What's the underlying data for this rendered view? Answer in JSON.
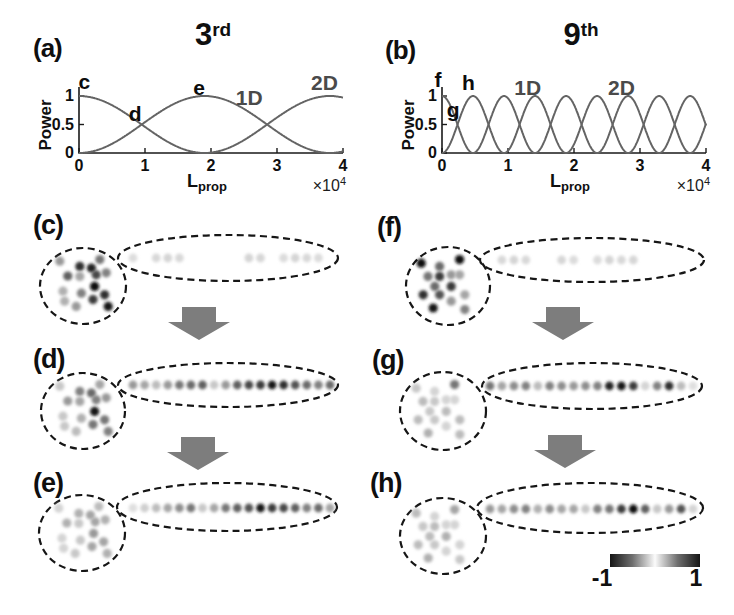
{
  "colors": {
    "curve": "#646464",
    "axis": "#1a1a1a",
    "dash": "#161616",
    "arrow": "#7d7d7d",
    "annotation_black": "#0c0c0c",
    "annotation_gray": "#4a4a4a"
  },
  "chart_data": [
    {
      "id": "a",
      "type": "line",
      "panel_label": "(a)",
      "title": "3rd",
      "title_base": "3",
      "title_sup": "rd",
      "ylabel": "Power",
      "xlabel_base": "L",
      "xlabel_sub": "prop",
      "x_multiplier_text": "×10",
      "x_multiplier_sup": "4",
      "xlim": [
        0,
        4
      ],
      "ylim": [
        0,
        1
      ],
      "xticks": [
        "0",
        "1",
        "2",
        "3",
        "4"
      ],
      "yticks": [
        "0",
        "0.5",
        "1"
      ],
      "series": [
        {
          "name": "2D",
          "fn": "cos2",
          "period": 3.8,
          "peak_x": [
            0,
            3.8
          ],
          "zero_x": [
            1.9
          ]
        },
        {
          "name": "1D",
          "fn": "sin2",
          "period": 3.8,
          "peak_x": [
            1.9
          ],
          "zero_x": [
            0,
            3.8
          ]
        }
      ],
      "annotations": [
        {
          "text": "c",
          "x": 0.08,
          "y": 1.24,
          "style": "black"
        },
        {
          "text": "d",
          "x": 0.85,
          "y": 0.68,
          "style": "black"
        },
        {
          "text": "e",
          "x": 1.82,
          "y": 1.14,
          "style": "black"
        },
        {
          "text": "1D",
          "x": 2.58,
          "y": 0.97,
          "style": "gray"
        },
        {
          "text": "2D",
          "x": 3.72,
          "y": 1.22,
          "style": "gray"
        }
      ]
    },
    {
      "id": "b",
      "type": "line",
      "panel_label": "(b)",
      "title": "9th",
      "title_base": "9",
      "title_sup": "th",
      "ylabel": "Power",
      "xlabel_base": "L",
      "xlabel_sub": "prop",
      "x_multiplier_text": "×10",
      "x_multiplier_sup": "4",
      "xlim": [
        0,
        4
      ],
      "ylim": [
        0,
        1
      ],
      "xticks": [
        "0",
        "1",
        "2",
        "3",
        "4"
      ],
      "yticks": [
        "0",
        "0.5",
        "1"
      ],
      "series": [
        {
          "name": "2D",
          "fn": "cos2",
          "period": 0.94,
          "peak_x": [
            0,
            0.94,
            1.88,
            2.82,
            3.76
          ],
          "zero_x": [
            0.47,
            1.41,
            2.35,
            3.29
          ]
        },
        {
          "name": "1D",
          "fn": "sin2",
          "period": 0.94,
          "peak_x": [
            0.47,
            1.41,
            2.35,
            3.29
          ],
          "zero_x": [
            0,
            0.94,
            1.88,
            2.82,
            3.76
          ]
        }
      ],
      "annotations": [
        {
          "text": "f",
          "x": -0.06,
          "y": 1.28,
          "style": "black"
        },
        {
          "text": "g",
          "x": 0.17,
          "y": 0.75,
          "style": "black"
        },
        {
          "text": "h",
          "x": 0.4,
          "y": 1.22,
          "style": "black"
        },
        {
          "text": "1D",
          "x": 1.3,
          "y": 1.14,
          "style": "gray"
        },
        {
          "text": "2D",
          "x": 2.72,
          "y": 1.14,
          "style": "gray"
        }
      ]
    }
  ],
  "dot_panels": {
    "speckle_positions_left": [
      [
        -0.58,
        -0.62
      ],
      [
        -0.08,
        -0.49
      ],
      [
        0.21,
        -0.45
      ],
      [
        0.42,
        -0.66
      ],
      [
        -0.38,
        -0.25
      ],
      [
        -0.08,
        -0.24
      ],
      [
        0.33,
        -0.28
      ],
      [
        0.58,
        -0.33
      ],
      [
        0.29,
        0.01
      ],
      [
        0.54,
        0.22
      ],
      [
        -0.5,
        0.13
      ],
      [
        -0.46,
        0.38
      ],
      [
        -0.04,
        0.18
      ],
      [
        0.25,
        0.34
      ],
      [
        -0.17,
        0.51
      ],
      [
        0.63,
        0.51
      ]
    ],
    "speckle_positions_right": [
      [
        -0.67,
        -0.57
      ],
      [
        -0.21,
        -0.49
      ],
      [
        0.29,
        -0.66
      ],
      [
        -0.5,
        -0.24
      ],
      [
        -0.21,
        -0.24
      ],
      [
        0.08,
        -0.28
      ],
      [
        0.29,
        -0.28
      ],
      [
        -0.33,
        0.01
      ],
      [
        0.08,
        0.01
      ],
      [
        -0.62,
        0.22
      ],
      [
        -0.21,
        0.22
      ],
      [
        0.42,
        0.22
      ],
      [
        0.08,
        0.38
      ],
      [
        -0.37,
        0.55
      ],
      [
        0.42,
        0.59
      ]
    ],
    "panels": [
      {
        "id": "c",
        "label": "(c)",
        "column": "left",
        "circle_intensities": [
          0.35,
          0.8,
          0.85,
          0.5,
          0.6,
          0.3,
          0.7,
          0.45,
          0.95,
          0.8,
          0.25,
          0.25,
          0.45,
          0.75,
          0.35,
          0.9
        ],
        "row_intensities": [
          0.06,
          0,
          0.08,
          0.1,
          0.08,
          0,
          0,
          0,
          0,
          0,
          0.1,
          0.09,
          0,
          0.07,
          0.1,
          0.08,
          0.07,
          0
        ]
      },
      {
        "id": "d",
        "label": "(d)",
        "column": "left",
        "circle_intensities": [
          0.15,
          0.45,
          0.55,
          0.3,
          0.35,
          0.3,
          0.45,
          0.35,
          0.9,
          0.5,
          0.15,
          0.15,
          0.25,
          0.5,
          0.2,
          0.45
        ],
        "row_intensities": [
          0.35,
          0.3,
          0.2,
          0.35,
          0.5,
          0.55,
          0.6,
          0.15,
          0.35,
          0.6,
          0.7,
          0.75,
          0.9,
          0.8,
          0.65,
          0.55,
          0.45,
          0.55
        ]
      },
      {
        "id": "e",
        "label": "(e)",
        "column": "left",
        "circle_intensities": [
          0.1,
          0.25,
          0.3,
          0.2,
          0.25,
          0.15,
          0.3,
          0.25,
          0.35,
          0.3,
          0.1,
          0.1,
          0.15,
          0.3,
          0.15,
          0.25
        ],
        "row_intensities": [
          0.05,
          0.12,
          0.2,
          0.3,
          0.4,
          0.5,
          0.15,
          0.3,
          0.5,
          0.6,
          0.65,
          0.9,
          0.75,
          0.7,
          0.6,
          0.45,
          0.55,
          0.3
        ]
      },
      {
        "id": "f",
        "label": "(f)",
        "column": "right",
        "circle_intensities": [
          0.95,
          0.55,
          0.95,
          0.5,
          0.75,
          0.35,
          0.3,
          0.55,
          0.75,
          0.8,
          0.65,
          0.3,
          0.35,
          0.9,
          0.45
        ],
        "row_intensities": [
          0,
          0.08,
          0.1,
          0.08,
          0,
          0,
          0.09,
          0.07,
          0,
          0.07,
          0.1,
          0.08,
          0.09,
          0,
          0,
          0,
          0,
          0
        ]
      },
      {
        "id": "g",
        "label": "(g)",
        "column": "right",
        "circle_intensities": [
          0.15,
          0.1,
          0.5,
          0.2,
          0.15,
          0.1,
          0.1,
          0.15,
          0.2,
          0.2,
          0.15,
          0.2,
          0.1,
          0.25,
          0.2
        ],
        "row_intensities": [
          0.5,
          0.3,
          0.4,
          0.45,
          0.2,
          0.45,
          0.4,
          0.35,
          0.4,
          0.45,
          0.85,
          0.9,
          0.75,
          0.1,
          0.45,
          0.8,
          0.2,
          0.05
        ]
      },
      {
        "id": "h",
        "label": "(h)",
        "column": "right",
        "circle_intensities": [
          0.2,
          0.1,
          0.3,
          0.15,
          0.2,
          0.1,
          0.1,
          0.2,
          0.25,
          0.2,
          0.15,
          0.1,
          0.1,
          0.25,
          0.15
        ],
        "row_intensities": [
          0.35,
          0.3,
          0.4,
          0.45,
          0.25,
          0.4,
          0.3,
          0.3,
          0.15,
          0.45,
          0.5,
          0.75,
          0.95,
          0.6,
          0.15,
          0.35,
          0.65,
          0.1
        ]
      }
    ]
  },
  "arrows": [
    {
      "from": "c",
      "to": "d"
    },
    {
      "from": "d",
      "to": "e"
    },
    {
      "from": "f",
      "to": "g"
    },
    {
      "from": "g",
      "to": "h"
    }
  ],
  "colorbar": {
    "min_label": "-1",
    "max_label": "1"
  }
}
